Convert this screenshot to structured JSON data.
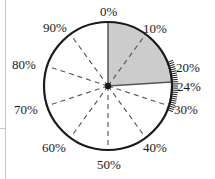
{
  "figure": {
    "type": "circular-percentage-dial",
    "title": "",
    "background_color": "#ffffff",
    "circle": {
      "center_x": 108,
      "center_y": 86,
      "radius": 64,
      "stroke_color": "#1a1a1a",
      "stroke_width": 2.2
    },
    "center_dot": {
      "name": "center-point",
      "radius": 3.2,
      "color": "#1a1a1a"
    },
    "shaded_wedge": {
      "name": "shaded-sector",
      "start_percent": 0,
      "end_percent": 24,
      "fill_color": "#cccccc",
      "edge_color": "#555555",
      "label": "24%"
    },
    "radial_lines": {
      "style": "dashed",
      "color": "#555555",
      "dash": "5 4",
      "width": 1.1
    },
    "minor_ticks": {
      "name": "minor-tick-marks",
      "from_percent": 19,
      "to_percent": 31,
      "step_percent": 0.5,
      "length": 6,
      "color": "#1a1a1a"
    },
    "page_rules": [
      {
        "name": "left-margin-rule",
        "x": 5,
        "y": 0,
        "w": 1,
        "h": 179
      },
      {
        "name": "left-crop-mark",
        "x": 0,
        "y": 128,
        "w": 6,
        "h": 1
      }
    ]
  },
  "chart_data": {
    "type": "pie",
    "title": "",
    "subtitle": "",
    "xlabel": "",
    "ylabel": "",
    "grid": true,
    "legend_position": "none",
    "axis_range_percent": [
      0,
      100
    ],
    "tick_step_percent": 10,
    "minor_tick_step_percent": 0.5,
    "categories": [
      "shaded",
      "unshaded"
    ],
    "values": [
      24,
      76
    ],
    "annotations": [
      {
        "text": "24%",
        "at_percent": 24,
        "type": "pointer-line"
      }
    ],
    "tick_labels": [
      {
        "value": 0,
        "label": "0%",
        "angle_deg": 0,
        "x": 100,
        "y": 5,
        "anchor": "start"
      },
      {
        "value": 10,
        "label": "10%",
        "angle_deg": 36,
        "x": 143,
        "y": 22,
        "anchor": "start"
      },
      {
        "value": 20,
        "label": "20%",
        "angle_deg": 72,
        "x": 176,
        "y": 61,
        "anchor": "start"
      },
      {
        "value": 24,
        "label": "24%",
        "angle_deg": 86.4,
        "x": 177,
        "y": 80,
        "anchor": "start"
      },
      {
        "value": 30,
        "label": "30%",
        "angle_deg": 108,
        "x": 174,
        "y": 103,
        "anchor": "start"
      },
      {
        "value": 40,
        "label": "40%",
        "angle_deg": 144,
        "x": 143,
        "y": 141,
        "anchor": "start"
      },
      {
        "value": 50,
        "label": "50%",
        "angle_deg": 180,
        "x": 97,
        "y": 158,
        "anchor": "start"
      },
      {
        "value": 60,
        "label": "60%",
        "angle_deg": 216,
        "x": 42,
        "y": 141,
        "anchor": "start"
      },
      {
        "value": 70,
        "label": "70%",
        "angle_deg": 252,
        "x": 14,
        "y": 103,
        "anchor": "start"
      },
      {
        "value": 80,
        "label": "80%",
        "angle_deg": 288,
        "x": 12,
        "y": 58,
        "anchor": "start"
      },
      {
        "value": 90,
        "label": "90%",
        "angle_deg": 324,
        "x": 43,
        "y": 21,
        "anchor": "start"
      }
    ]
  }
}
